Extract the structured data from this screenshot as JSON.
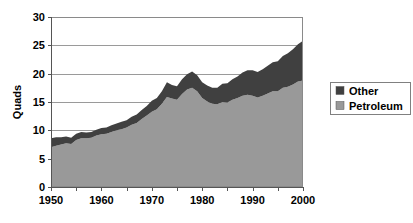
{
  "chart_data": {
    "type": "area",
    "stacked": true,
    "title": "",
    "xlabel": "",
    "ylabel": "Quads",
    "xlim": [
      1950,
      2000
    ],
    "ylim": [
      0,
      30
    ],
    "grid": "horizontal",
    "legend_position": "right",
    "y_ticks": [
      0,
      5,
      10,
      15,
      20,
      25,
      30
    ],
    "y_tick_labels": [
      "0",
      "5",
      "10",
      "15",
      "20",
      "25",
      "30"
    ],
    "x_ticks": [
      1950,
      1955,
      1960,
      1965,
      1970,
      1975,
      1980,
      1985,
      1990,
      1995,
      2000
    ],
    "x_tick_labels": [
      "1950",
      "",
      "1960",
      "",
      "1970",
      "",
      "1980",
      "",
      "1990",
      "",
      "2000"
    ],
    "x_labeled_ticks": [
      1950,
      1960,
      1970,
      1980,
      1990,
      2000
    ],
    "x": [
      1950,
      1951,
      1952,
      1953,
      1954,
      1955,
      1956,
      1957,
      1958,
      1959,
      1960,
      1961,
      1962,
      1963,
      1964,
      1965,
      1966,
      1967,
      1968,
      1969,
      1970,
      1971,
      1972,
      1973,
      1974,
      1975,
      1976,
      1977,
      1978,
      1979,
      1980,
      1981,
      1982,
      1983,
      1984,
      1985,
      1986,
      1987,
      1988,
      1989,
      1990,
      1991,
      1992,
      1993,
      1994,
      1995,
      1996,
      1997,
      1998,
      1999,
      2000
    ],
    "series": [
      {
        "name": "Petroleum",
        "color": "#999999",
        "values": [
          7.0,
          7.3,
          7.5,
          7.7,
          7.6,
          8.3,
          8.6,
          8.6,
          8.7,
          9.1,
          9.3,
          9.4,
          9.7,
          10.0,
          10.2,
          10.5,
          11.0,
          11.3,
          12.0,
          12.6,
          13.3,
          13.7,
          14.7,
          15.9,
          15.6,
          15.4,
          16.4,
          17.2,
          17.5,
          16.9,
          15.7,
          15.1,
          14.7,
          14.6,
          15.0,
          14.9,
          15.4,
          15.7,
          16.1,
          16.3,
          16.1,
          15.8,
          16.1,
          16.5,
          16.9,
          16.9,
          17.5,
          17.7,
          18.1,
          18.6,
          18.8
        ]
      },
      {
        "name": "Other",
        "color": "#404040",
        "values": [
          1.6,
          1.5,
          1.3,
          1.2,
          1.1,
          1.1,
          1.1,
          1.0,
          1.0,
          1.0,
          1.1,
          1.1,
          1.2,
          1.2,
          1.3,
          1.3,
          1.4,
          1.5,
          1.6,
          1.7,
          1.9,
          2.0,
          2.2,
          2.6,
          2.4,
          2.4,
          2.6,
          2.7,
          2.9,
          2.8,
          2.8,
          2.8,
          2.8,
          2.9,
          3.2,
          3.4,
          3.6,
          3.8,
          4.1,
          4.3,
          4.5,
          4.5,
          4.7,
          4.9,
          5.1,
          5.3,
          5.6,
          5.9,
          6.2,
          6.6,
          7.0
        ]
      }
    ],
    "totals": [
      8.6,
      8.8,
      8.8,
      8.9,
      8.7,
      9.4,
      9.7,
      9.6,
      9.7,
      10.1,
      10.4,
      10.5,
      10.9,
      11.2,
      11.5,
      11.8,
      12.4,
      12.8,
      13.6,
      14.3,
      15.2,
      15.7,
      16.9,
      18.5,
      18.0,
      17.8,
      19.0,
      19.9,
      20.4,
      19.7,
      18.5,
      17.9,
      17.5,
      17.5,
      18.2,
      18.3,
      19.0,
      19.5,
      20.2,
      20.6,
      20.6,
      20.3,
      20.8,
      21.4,
      22.0,
      22.2,
      23.1,
      23.6,
      24.3,
      25.2,
      25.8
    ]
  },
  "legend": {
    "items": [
      {
        "label": "Other",
        "color": "#404040"
      },
      {
        "label": "Petroleum",
        "color": "#999999"
      }
    ]
  },
  "axes": {
    "y_title": "Quads"
  }
}
